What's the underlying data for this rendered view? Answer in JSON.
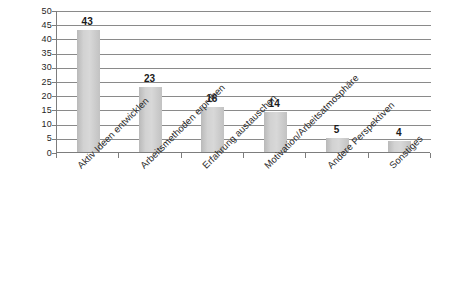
{
  "chart_data": {
    "type": "bar",
    "title": "",
    "subtitle": "",
    "xlabel": "",
    "ylabel": "",
    "ylim": [
      0,
      50
    ],
    "ytick_step": 5,
    "yticks": [
      0,
      5,
      10,
      15,
      20,
      25,
      30,
      35,
      40,
      45,
      50
    ],
    "grid": true,
    "grid_axis": "y",
    "legend": false,
    "legend_position": "none",
    "value_labels": true,
    "bar_color": "#d2d2d2",
    "grid_color": "#8a8a8a",
    "axis_color": "#7d7d7d",
    "background_color": "#ffffff",
    "label_rotation": -45,
    "categories": [
      "Aktiv Ideen entwicklen",
      "Arbeitsmethoden erproben",
      "Erfahrung austauschen",
      "Motivation/Arbeitsatmosphäre",
      "Andere Perspektiven",
      "Sonstiges"
    ],
    "values": [
      43,
      23,
      16,
      14,
      5,
      4
    ]
  }
}
